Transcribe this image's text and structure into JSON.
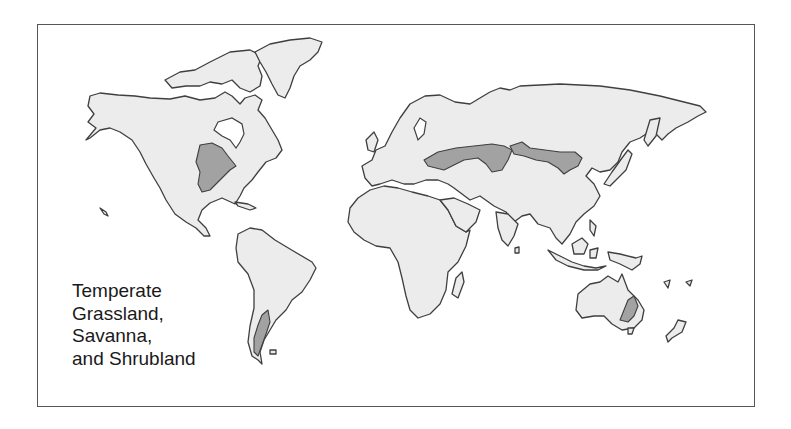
{
  "map": {
    "type": "world biome distribution map",
    "legend": {
      "lines": [
        "Temperate",
        "Grassland,",
        "Savanna,",
        "and Shrubland"
      ]
    },
    "highlighted_regions": [
      "North American Great Plains",
      "Patagonia",
      "Eurasian Steppe",
      "Mongolian Steppe",
      "Southeastern Australia"
    ],
    "colors": {
      "land": "#ececec",
      "biome": "#a2a2a2",
      "outline": "#3f3f3f",
      "background": "#ffffff"
    }
  }
}
